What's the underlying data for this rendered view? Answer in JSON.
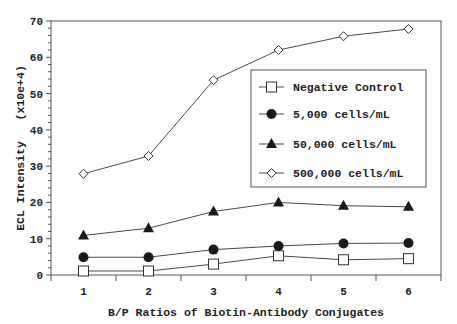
{
  "chart_data": {
    "type": "line",
    "title": "",
    "xlabel": "B/P Ratios of Biotin-Antibody Conjugates",
    "ylabel": "ECL Intensity   (x10e+4)",
    "x": [
      1,
      2,
      3,
      4,
      5,
      6
    ],
    "xticks": [
      "1",
      "2",
      "3",
      "4",
      "5",
      "6"
    ],
    "xlim": [
      0.5,
      6.5
    ],
    "ylim": [
      0,
      70
    ],
    "yticks": [
      "0",
      "10",
      "20",
      "30",
      "40",
      "50",
      "60",
      "70"
    ],
    "grid": false,
    "legend_position": "inside-right",
    "series": [
      {
        "name": "Negative Control",
        "marker": "open-square",
        "values": [
          1.1,
          1.1,
          3.0,
          5.3,
          4.2,
          4.5
        ]
      },
      {
        "name": "5,000 cells/mL",
        "marker": "filled-circle",
        "values": [
          4.9,
          4.9,
          7.0,
          8.0,
          8.7,
          8.8
        ]
      },
      {
        "name": "50,000 cells/mL",
        "marker": "filled-triangle",
        "values": [
          10.9,
          12.9,
          17.5,
          20.0,
          19.1,
          18.8
        ]
      },
      {
        "name": "500,000 cells/mL",
        "marker": "open-diamond",
        "values": [
          27.9,
          32.8,
          53.7,
          62.0,
          65.8,
          67.8
        ]
      }
    ]
  },
  "colors": {
    "line": "#4a4a4a",
    "marker_fill": "#1a1a1a",
    "axis": "#555555",
    "text": "#222222"
  }
}
